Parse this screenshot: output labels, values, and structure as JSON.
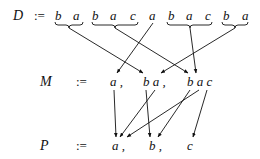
{
  "diagram": {
    "rows": [
      {
        "name": "D",
        "label": "D",
        "assign": ":=",
        "symbols": [
          "b",
          "a",
          "b",
          "a",
          "c",
          "a",
          "b",
          "a",
          "c",
          "b",
          "a"
        ],
        "groups": [
          {
            "symbols": "b a",
            "braced": true
          },
          {
            "symbols": "b a c",
            "braced": true
          },
          {
            "symbols": "a",
            "braced": false
          },
          {
            "symbols": "b a c",
            "braced": true
          },
          {
            "symbols": "b a",
            "braced": true
          }
        ]
      },
      {
        "name": "M",
        "label": "M",
        "assign": ":=",
        "items": [
          "a ,",
          "b a ,",
          "b a c"
        ]
      },
      {
        "name": "P",
        "label": "P",
        "assign": ":=",
        "items": [
          "a ,",
          "b ,",
          "c"
        ]
      }
    ],
    "edges_D_to_M": [
      {
        "from": "b a",
        "to": "b a"
      },
      {
        "from": "b a c",
        "to": "b a c"
      },
      {
        "from": "a",
        "to": "a"
      },
      {
        "from": "b a c",
        "to": "b a c"
      },
      {
        "from": "b a",
        "to": "b a"
      }
    ],
    "edges_M_to_P": [
      {
        "from": "a",
        "to": "a"
      },
      {
        "from": "b a / b",
        "to": "b"
      },
      {
        "from": "b a / a",
        "to": "a"
      },
      {
        "from": "b a c / b",
        "to": "b"
      },
      {
        "from": "b a c / a",
        "to": "a"
      },
      {
        "from": "b a c / c",
        "to": "c"
      }
    ]
  },
  "text": {
    "D": "D",
    "M": "M",
    "P": "P",
    "assign": ":=",
    "d": [
      "b",
      "a",
      "b",
      "a",
      "c",
      "a",
      "b",
      "a",
      "c",
      "b",
      "a"
    ],
    "m": [
      "a ,",
      "b a ,",
      "b a c"
    ],
    "p": [
      "a ,",
      "b ,",
      "c"
    ]
  }
}
